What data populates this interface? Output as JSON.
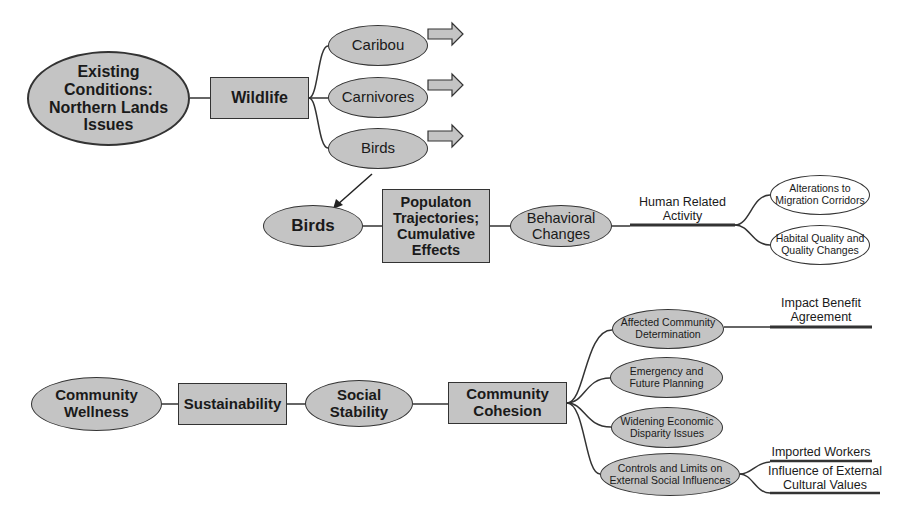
{
  "diagram": {
    "top": {
      "root": "Existing\nConditions:\nNorthern Lands\nIssues",
      "category": "Wildlife",
      "branches": [
        "Caribou",
        "Carnivores",
        "Birds"
      ]
    },
    "birds": {
      "start": "Birds",
      "process": "Populaton\nTrajectories;\nCumulative\nEffects",
      "effect": "Behavioral\nChanges",
      "driver_label": "Human Related\nActivity",
      "outcomes": [
        "Alterations to\nMigration Corridors",
        "Habital Quality and\nQuality Changes"
      ]
    },
    "community": {
      "start": "Community\nWellness",
      "sustainability": "Sustainability",
      "stability": "Social\nStability",
      "cohesion": "Community\nCohesion",
      "issues": [
        "Affected Community\nDetermination",
        "Emergency and\nFuture Planning",
        "Widening Economic\nDisparity Issues",
        "Controls and Limits on\nExternal Social Influences"
      ],
      "impact_label": "Impact Benefit\nAgreement",
      "external_labels": [
        "Imported Workers",
        "Influence of External\nCultural Values"
      ]
    },
    "colors": {
      "fill": "#c4c4c4",
      "stroke": "#333333",
      "text": "#1a1a1a",
      "background": "#ffffff"
    }
  }
}
